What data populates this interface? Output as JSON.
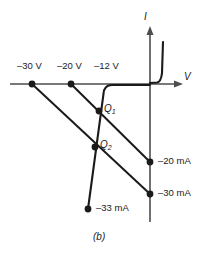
{
  "figure": {
    "caption": "(b)",
    "axes": {
      "x_label": "V",
      "y_label": "I",
      "origin": {
        "x": 150,
        "y": 84
      }
    },
    "voltage_labels": [
      {
        "name": "v-minus-30",
        "text": "–30 V",
        "x": 32
      },
      {
        "name": "v-minus-20",
        "text": "–20 V",
        "x": 71
      },
      {
        "name": "v-minus-12",
        "text": "–12 V",
        "x": 103
      }
    ],
    "current_labels": [
      {
        "name": "i-minus-20",
        "text": "–20 mA",
        "y": 162
      },
      {
        "name": "i-minus-30",
        "text": "–30 mA",
        "y": 194
      },
      {
        "name": "i-minus-33",
        "text": "–33 mA",
        "y": 209
      }
    ],
    "operating_points": [
      {
        "name": "q1",
        "label": "Q",
        "subscript": "1",
        "x": 99,
        "y": 111
      },
      {
        "name": "q2",
        "label": "Q",
        "subscript": "2",
        "x": 95,
        "y": 147
      }
    ],
    "colors": {
      "curve": "#1a1a1a",
      "axis": "#4d4d4d",
      "background": "#ffffff"
    },
    "diode_curve": {
      "breakdown_voltage": "–12 V",
      "description": "Zener diode reverse breakdown characteristic with two load lines"
    },
    "load_lines": [
      {
        "name": "load-line-30v",
        "from_v": "–30 V",
        "to_i": "–30 mA"
      },
      {
        "name": "load-line-20v",
        "from_v": "–20 V",
        "to_i": "–20 mA"
      }
    ]
  }
}
